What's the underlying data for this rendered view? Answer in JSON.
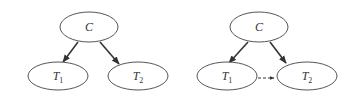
{
  "diagrams": [
    {
      "id": "left",
      "nodes": [
        {
          "id": "C",
          "label": "C",
          "sub": "",
          "cx": 89,
          "cy": 27,
          "rx": 29,
          "ry": 15
        },
        {
          "id": "T1",
          "label": "T",
          "sub": "1",
          "cx": 58,
          "cy": 76,
          "rx": 30,
          "ry": 14
        },
        {
          "id": "T2",
          "label": "T",
          "sub": "2",
          "cx": 138,
          "cy": 76,
          "rx": 30,
          "ry": 14
        }
      ],
      "edges": [
        {
          "from": "C",
          "to": "T1",
          "x1": 78,
          "y1": 42,
          "x2": 63,
          "y2": 62,
          "style": "solid"
        },
        {
          "from": "C",
          "to": "T2",
          "x1": 100,
          "y1": 42,
          "x2": 119,
          "y2": 64,
          "style": "solid"
        }
      ]
    },
    {
      "id": "right",
      "nodes": [
        {
          "id": "C",
          "label": "C",
          "sub": "",
          "cx": 259,
          "cy": 27,
          "rx": 29,
          "ry": 15
        },
        {
          "id": "T1",
          "label": "T",
          "sub": "1",
          "cx": 227,
          "cy": 76,
          "rx": 30,
          "ry": 14
        },
        {
          "id": "T2",
          "label": "T",
          "sub": "2",
          "cx": 307,
          "cy": 76,
          "rx": 30,
          "ry": 14
        }
      ],
      "edges": [
        {
          "from": "C",
          "to": "T1",
          "x1": 248,
          "y1": 42,
          "x2": 229,
          "y2": 63,
          "style": "solid"
        },
        {
          "from": "C",
          "to": "T2",
          "x1": 270,
          "y1": 42,
          "x2": 286,
          "y2": 63,
          "style": "solid"
        },
        {
          "from": "T1",
          "to": "T2",
          "x1": 243,
          "y1": 78,
          "x2": 274,
          "y2": 78,
          "style": "dashed"
        }
      ]
    }
  ],
  "colors": {
    "stroke": "#555555",
    "edge": "#333333",
    "background": "#ffffff"
  }
}
